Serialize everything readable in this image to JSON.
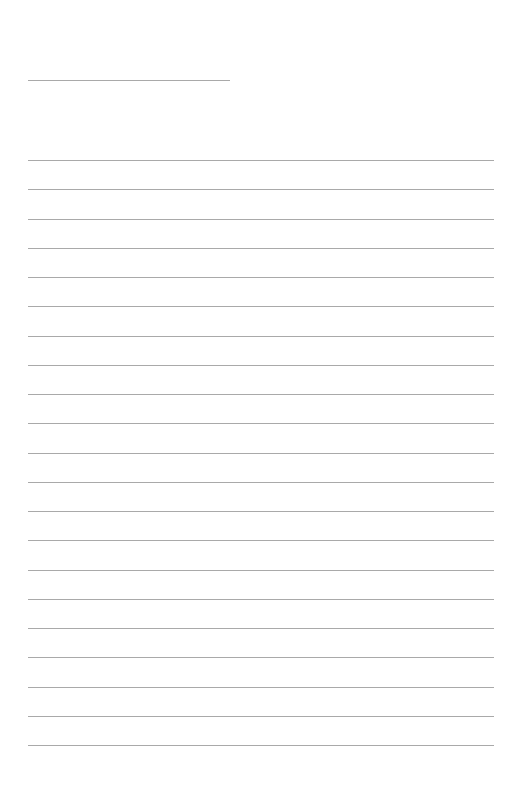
{
  "page": {
    "type": "blank lined writing sheet",
    "background_color": "#ffffff",
    "line_color": "#a9a9a9",
    "title_line": {
      "label": "",
      "x": 28,
      "y": 80,
      "width": 202
    },
    "ruled_lines": {
      "count": 21,
      "x": 28,
      "width": 466,
      "first_y": 160,
      "spacing": 29.25,
      "text": [
        "",
        "",
        "",
        "",
        "",
        "",
        "",
        "",
        "",
        "",
        "",
        "",
        "",
        "",
        "",
        "",
        "",
        "",
        "",
        "",
        ""
      ]
    }
  }
}
